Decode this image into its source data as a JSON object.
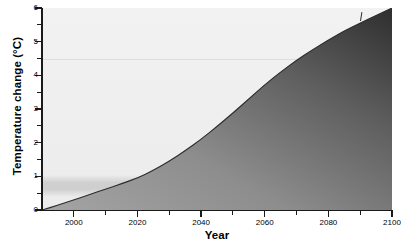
{
  "chart_data": {
    "type": "area",
    "title": "",
    "xlabel": "Year",
    "ylabel": "Temperature change (°C)",
    "xlim": [
      1990,
      2100
    ],
    "ylim": [
      0,
      6
    ],
    "grid": false,
    "legend_position": "none",
    "x_major_ticks": [
      2000,
      2020,
      2040,
      2060,
      2080,
      2100
    ],
    "x_major_tick_labels": [
      "2000",
      "2020",
      "2040",
      "2060",
      "2080",
      "2100"
    ],
    "x_minor_ticks": [
      1990,
      2010,
      2030,
      2050,
      2070,
      2090
    ],
    "y_major_ticks": [
      0,
      1,
      2,
      3,
      4,
      5,
      6
    ],
    "y_major_tick_labels": [
      "0",
      "1",
      "2",
      "3",
      "4",
      "5",
      "6"
    ],
    "y_minor_ticks": [
      0.5,
      1.5,
      2.5,
      3.5,
      4.5,
      5.5
    ],
    "x": [
      1990,
      1995,
      2000,
      2005,
      2010,
      2015,
      2020,
      2025,
      2030,
      2035,
      2040,
      2045,
      2050,
      2055,
      2060,
      2065,
      2070,
      2075,
      2080,
      2085,
      2090,
      2095,
      2100
    ],
    "values": [
      0.0,
      0.14,
      0.3,
      0.46,
      0.62,
      0.78,
      0.95,
      1.18,
      1.45,
      1.76,
      2.1,
      2.48,
      2.88,
      3.3,
      3.72,
      4.1,
      4.45,
      4.76,
      5.05,
      5.32,
      5.55,
      5.78,
      6.0
    ],
    "series": [
      {
        "name": "Temperature change",
        "values": [
          0.0,
          0.14,
          0.3,
          0.46,
          0.62,
          0.78,
          0.95,
          1.18,
          1.45,
          1.76,
          2.1,
          2.48,
          2.88,
          3.3,
          3.72,
          4.1,
          4.45,
          4.76,
          5.05,
          5.32,
          5.55,
          5.78,
          6.0
        ]
      }
    ],
    "annotations": [
      {
        "name": "reference-line",
        "y": 4.5,
        "style": "faint-horizontal-line"
      },
      {
        "name": "shaded-band",
        "y_from": 0.55,
        "y_to": 0.85,
        "style": "faint-horizontal-band"
      },
      {
        "name": "curve-tick-marker",
        "x": 2090,
        "y": 5.55
      }
    ],
    "colors": {
      "plot_background": "#efefef",
      "fill_light": "#9c9c9c",
      "fill_dark": "#323232",
      "curve_line": "#2b2b2b",
      "axis": "#1a1a1a",
      "text": "#000000",
      "reference_line": "#dcdcdc"
    }
  }
}
